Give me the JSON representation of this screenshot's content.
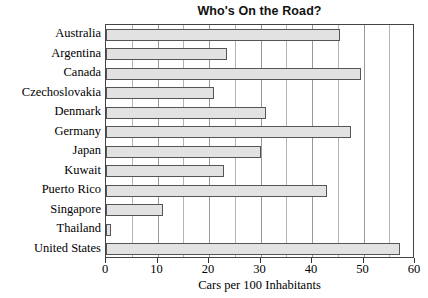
{
  "chart_data": {
    "type": "bar",
    "orientation": "horizontal",
    "title": "Who's On the Road?",
    "xlabel": "Cars per 100 Inhabitants",
    "ylabel": "",
    "xlim": [
      0,
      60
    ],
    "xticks": [
      0,
      10,
      20,
      30,
      40,
      50,
      60
    ],
    "xticklabels": [
      "0",
      "10",
      "20",
      "30",
      "40",
      "50",
      "60"
    ],
    "minor_gridline_step": 5,
    "grid": true,
    "legend": null,
    "categories": [
      "Australia",
      "Argentina",
      "Canada",
      "Czechoslovakia",
      "Denmark",
      "Germany",
      "Japan",
      "Kuwait",
      "Puerto Rico",
      "Singapore",
      "Thailand",
      "United States"
    ],
    "values": [
      45.5,
      23.5,
      49.5,
      21,
      31,
      47.5,
      30,
      23,
      43,
      11,
      1,
      57
    ],
    "bar_fill_color": "#e2e2e2",
    "bar_edge_color": "#555555",
    "plot_border_color": "#444444",
    "gridline_color": "#b4b4b4",
    "background_color": "#ffffff",
    "text_color": "#000000"
  }
}
